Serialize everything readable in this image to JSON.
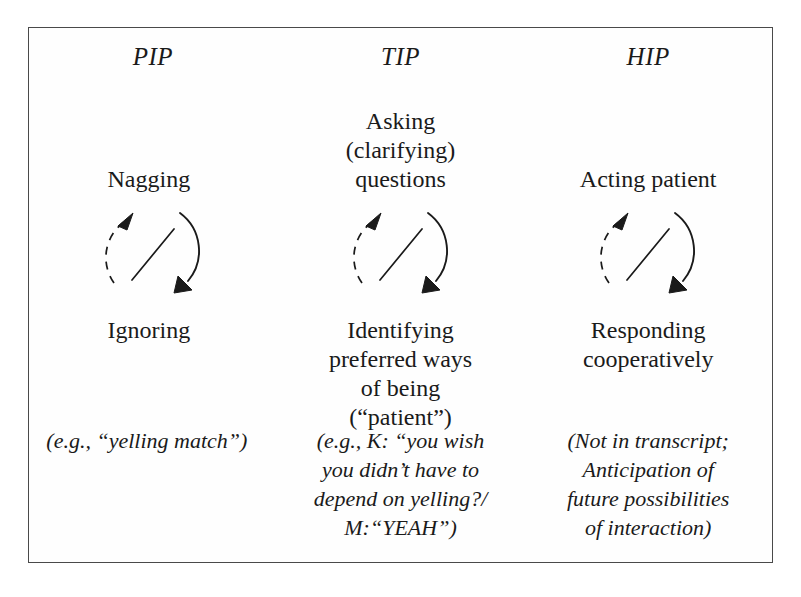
{
  "figure": {
    "columns": [
      {
        "id": "pip",
        "header": "PIP",
        "top_label": "Nagging",
        "bottom_label": "Ignoring",
        "example": "(e.g., “yelling match”)"
      },
      {
        "id": "tip",
        "header": "TIP",
        "top_label": "Asking\n(clarifying)\nquestions",
        "bottom_label": "Identifying\npreferred ways\nof being\n(“patient”)",
        "example": "(e.g., K: “you wish\nyou didn’t have to\ndepend on yelling?/\nM:“YEAH”)"
      },
      {
        "id": "hip",
        "header": "HIP",
        "top_label": "Acting patient",
        "bottom_label": "Responding\ncooperatively",
        "example": "(Not in transcript;\nAnticipation of\nfuture possibilities\nof interaction)"
      }
    ],
    "cycle_diagram": {
      "description": "circular two-way cycle with a diagonal slash through the centre",
      "left_arc_style": "dashed",
      "left_arc_direction": "upward",
      "right_arc_style": "solid",
      "right_arc_direction": "downward",
      "stroke_color": "#1a1a1a"
    },
    "colors": {
      "ink": "#1a1a1a",
      "frame": "#4a4a4a",
      "page": "#ffffff"
    }
  }
}
